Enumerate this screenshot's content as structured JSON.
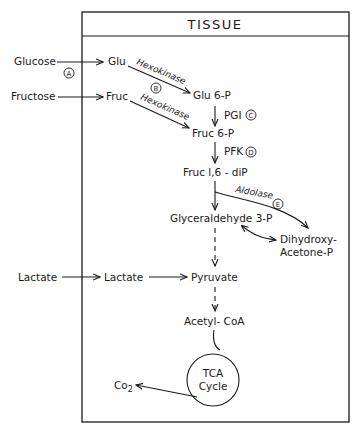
{
  "title": "TISSUE",
  "external": {
    "glucose": "Glucose",
    "fructose": "Fructose",
    "lactate": "Lactate",
    "co2": "Co",
    "co2_sub": "2"
  },
  "markers": {
    "a": "A",
    "b": "B",
    "c": "C",
    "d": "D",
    "e": "E"
  },
  "nodes": {
    "glu": "Glu",
    "fruc": "Fruc",
    "glu6p": "Glu 6-P",
    "fruc6p": "Fruc 6-P",
    "fruc16dip": "Fruc l,6 - diP",
    "g3p": "Glyceraldehyde 3-P",
    "dhap_1": "Dihydroxy-",
    "dhap_2": "Acetone-P",
    "lactate": "Lactate",
    "pyruvate": "Pyruvate",
    "acetylcoa": "Acetyl- CoA",
    "tca_1": "TCA",
    "tca_2": "Cycle"
  },
  "enzymes": {
    "hexokinase_glu": "Hexokinase",
    "hexokinase_fruc": "Hexokinase",
    "pgi": "PGI",
    "pfk": "PFK",
    "aldolase": "Aldolase"
  }
}
